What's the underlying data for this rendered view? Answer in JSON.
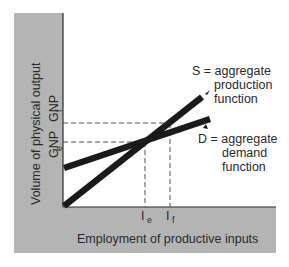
{
  "diagram": {
    "type": "economics-line-diagram",
    "y_axis_label": "Volume of physical output",
    "x_axis_label": "Employment of productive inputs",
    "y_ticks": [
      {
        "main": "GNP",
        "sub": "f"
      },
      {
        "main": "GNP",
        "sub": "e"
      }
    ],
    "x_ticks": [
      {
        "main": "I",
        "sub": "e"
      },
      {
        "main": "I",
        "sub": "f"
      }
    ],
    "series": [
      {
        "symbol": "S",
        "name": "aggregate production function",
        "label_lines": [
          "S = aggregate",
          "production",
          "function"
        ],
        "start": [
          0,
          0
        ],
        "end": [
          145,
          89
        ]
      },
      {
        "symbol": "D",
        "name": "aggregate demand function",
        "label_lines": [
          "D = aggregate",
          "demand",
          "function"
        ],
        "start": [
          0,
          39
        ],
        "end": [
          145,
          89
        ]
      }
    ],
    "reference_lines": {
      "GNP_e_level": "equilibrium output at intersection (I_e)",
      "GNP_f_level": "full-employment output (I_f)"
    },
    "colors": {
      "frame_gray": "#b4b4b4",
      "line": "#1a1a1a",
      "dashed": "#555555",
      "text": "#2a2a2a"
    }
  }
}
